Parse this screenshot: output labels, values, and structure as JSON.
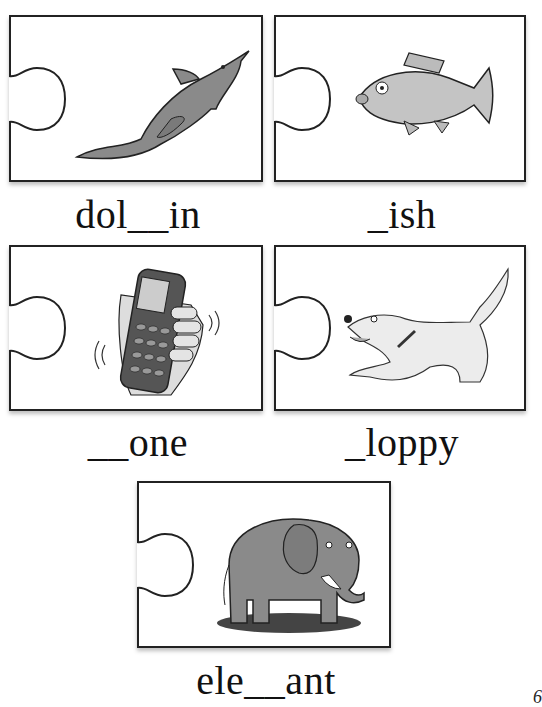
{
  "worksheet": {
    "cards": [
      {
        "id": "dolphin",
        "word": "dol__in",
        "picture": "dolphin-icon"
      },
      {
        "id": "fish",
        "word": "_ish",
        "picture": "fish-icon"
      },
      {
        "id": "phone",
        "word": "__one",
        "picture": "mobile-phone-icon"
      },
      {
        "id": "dog",
        "word": "_loppy",
        "picture": "dog-icon"
      },
      {
        "id": "elephant",
        "word": "ele__ant",
        "picture": "elephant-icon"
      }
    ],
    "page_number": "6"
  },
  "colors": {
    "border": "#222222",
    "illustration_gray": "#8a8a8a",
    "background": "#ffffff"
  }
}
